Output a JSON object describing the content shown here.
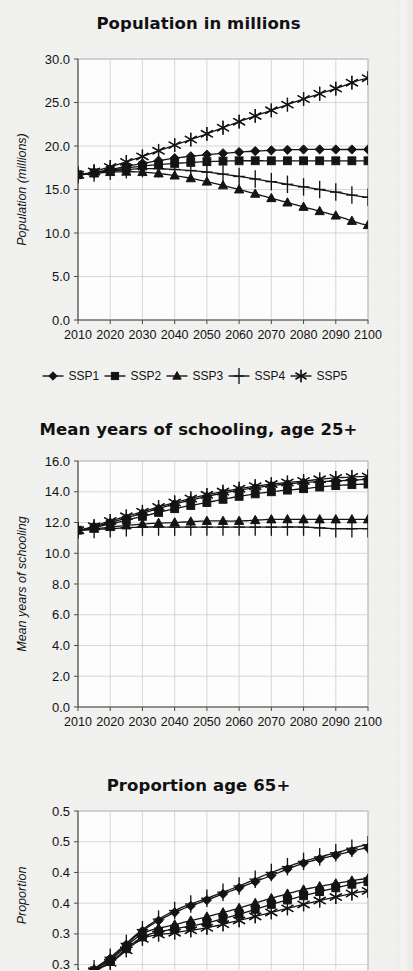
{
  "page": {
    "background_color": "#f3f3f1",
    "ink_color": "#141414"
  },
  "legend": {
    "entries": [
      {
        "label": "SSP1",
        "marker": "diamond"
      },
      {
        "label": "SSP2",
        "marker": "square"
      },
      {
        "label": "SSP3",
        "marker": "triangle"
      },
      {
        "label": "SSP4",
        "marker": "plus"
      },
      {
        "label": "SSP5",
        "marker": "asterisk"
      }
    ]
  },
  "chart_data": [
    {
      "id": "population",
      "type": "line",
      "title": "Population in millions",
      "xlabel": "",
      "ylabel": "Population (millions)",
      "x": [
        2010,
        2020,
        2030,
        2040,
        2050,
        2060,
        2070,
        2080,
        2090,
        2100
      ],
      "xtick_labels": [
        "2010",
        "2020",
        "2030",
        "2040",
        "2050",
        "2060",
        "2070",
        "2080",
        "2090",
        "2100"
      ],
      "xlim": [
        2010,
        2100
      ],
      "ylim": [
        0.0,
        30.0
      ],
      "ytick_values": [
        0.0,
        5.0,
        10.0,
        15.0,
        20.0,
        25.0,
        30.0
      ],
      "ytick_labels": [
        "0.0",
        "5.0",
        "10.0",
        "15.0",
        "20.0",
        "25.0",
        "30.0"
      ],
      "grid": true,
      "legend_position": "below",
      "marker_every_years": 5,
      "series": [
        {
          "name": "SSP1",
          "marker": "diamond",
          "values": [
            16.7,
            17.3,
            18.0,
            18.6,
            19.0,
            19.3,
            19.5,
            19.6,
            19.6,
            19.6
          ]
        },
        {
          "name": "SSP2",
          "marker": "square",
          "values": [
            16.7,
            17.2,
            17.7,
            18.0,
            18.2,
            18.3,
            18.3,
            18.3,
            18.3,
            18.3
          ]
        },
        {
          "name": "SSP3",
          "marker": "triangle",
          "values": [
            16.7,
            17.0,
            17.0,
            16.6,
            15.9,
            15.0,
            14.0,
            13.0,
            12.0,
            10.9
          ]
        },
        {
          "name": "SSP4",
          "marker": "plus",
          "values": [
            16.7,
            17.1,
            17.4,
            17.3,
            17.0,
            16.5,
            15.9,
            15.3,
            14.7,
            14.1
          ]
        },
        {
          "name": "SSP5",
          "marker": "asterisk",
          "values": [
            16.7,
            17.6,
            18.8,
            20.1,
            21.4,
            22.8,
            24.1,
            25.4,
            26.6,
            27.8
          ]
        }
      ]
    },
    {
      "id": "schooling",
      "type": "line",
      "title": "Mean years of schooling, age 25+",
      "xlabel": "",
      "ylabel": "Mean years of schooling",
      "x": [
        2010,
        2020,
        2030,
        2040,
        2050,
        2060,
        2070,
        2080,
        2090,
        2100
      ],
      "xtick_labels": [
        "2010",
        "2020",
        "2030",
        "2040",
        "2050",
        "2060",
        "2070",
        "2080",
        "2090",
        "2100"
      ],
      "xlim": [
        2010,
        2100
      ],
      "ylim": [
        0.0,
        16.0
      ],
      "ytick_values": [
        0.0,
        2.0,
        4.0,
        6.0,
        8.0,
        10.0,
        12.0,
        14.0,
        16.0
      ],
      "ytick_labels": [
        "0.0",
        "2.0",
        "4.0",
        "6.0",
        "8.0",
        "10.0",
        "12.0",
        "14.0",
        "16.0"
      ],
      "grid": true,
      "legend_position": "none",
      "marker_every_years": 5,
      "series": [
        {
          "name": "SSP1",
          "marker": "diamond",
          "values": [
            11.5,
            12.0,
            12.6,
            13.2,
            13.7,
            14.1,
            14.4,
            14.6,
            14.7,
            14.8
          ]
        },
        {
          "name": "SSP2",
          "marker": "square",
          "values": [
            11.5,
            11.9,
            12.4,
            12.9,
            13.3,
            13.7,
            14.0,
            14.2,
            14.4,
            14.5
          ]
        },
        {
          "name": "SSP3",
          "marker": "triangle",
          "values": [
            11.5,
            11.7,
            11.9,
            12.0,
            12.1,
            12.1,
            12.2,
            12.2,
            12.2,
            12.2
          ]
        },
        {
          "name": "SSP4",
          "marker": "plus",
          "values": [
            11.5,
            11.6,
            11.7,
            11.7,
            11.7,
            11.7,
            11.7,
            11.7,
            11.6,
            11.6
          ]
        },
        {
          "name": "SSP5",
          "marker": "asterisk",
          "values": [
            11.5,
            12.1,
            12.7,
            13.3,
            13.8,
            14.2,
            14.5,
            14.7,
            14.9,
            15.0
          ]
        }
      ]
    },
    {
      "id": "proportion65",
      "type": "line",
      "title": "Proportion age 65+",
      "xlabel": "",
      "ylabel": "Proportion",
      "x": [
        2010,
        2020,
        2030,
        2040,
        2050,
        2060,
        2070,
        2080,
        2090,
        2100
      ],
      "xtick_labels": [
        "2010",
        "2020",
        "2030",
        "2040",
        "2050",
        "2060",
        "2070",
        "2080",
        "2090",
        "2100"
      ],
      "xlim": [
        2010,
        2100
      ],
      "ylim": [
        0.275,
        0.55
      ],
      "ytick_values": [
        0.3,
        0.35,
        0.4,
        0.45,
        0.5,
        0.55
      ],
      "ytick_labels": [
        "0.3",
        "0.3",
        "0.4",
        "0.4",
        "0.5",
        "0.5"
      ],
      "grid": true,
      "legend_position": "none",
      "cropped": true,
      "marker_every_years": 5,
      "series": [
        {
          "name": "SSP1",
          "marker": "diamond",
          "values": [
            0.28,
            0.31,
            0.355,
            0.385,
            0.405,
            0.425,
            0.445,
            0.465,
            0.478,
            0.49
          ]
        },
        {
          "name": "SSP2",
          "marker": "square",
          "values": [
            0.28,
            0.305,
            0.345,
            0.358,
            0.368,
            0.382,
            0.398,
            0.412,
            0.425,
            0.435
          ]
        },
        {
          "name": "SSP3",
          "marker": "triangle",
          "values": [
            0.28,
            0.308,
            0.35,
            0.365,
            0.378,
            0.392,
            0.408,
            0.422,
            0.432,
            0.44
          ]
        },
        {
          "name": "SSP4",
          "marker": "plus",
          "values": [
            0.28,
            0.312,
            0.357,
            0.388,
            0.408,
            0.428,
            0.45,
            0.468,
            0.482,
            0.495
          ]
        },
        {
          "name": "SSP5",
          "marker": "asterisk",
          "values": [
            0.28,
            0.303,
            0.342,
            0.352,
            0.36,
            0.372,
            0.385,
            0.398,
            0.41,
            0.42
          ]
        }
      ]
    }
  ]
}
